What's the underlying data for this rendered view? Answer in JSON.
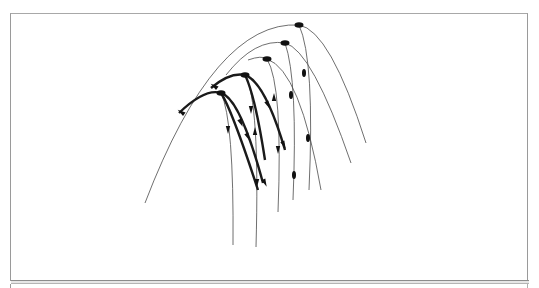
{
  "figure": {
    "colors": {
      "stroke": "#1a1a1a",
      "thin_stroke": "#4a4a4a",
      "frame": "#9a9a9a"
    },
    "outer_envelope": {
      "start": [
        145,
        203
      ],
      "apex": [
        299,
        25
      ],
      "end": [
        366,
        143
      ]
    },
    "apex_markers": [
      [
        299,
        25
      ],
      [
        285,
        43
      ],
      [
        267,
        59
      ],
      [
        245,
        75
      ],
      [
        221,
        93
      ]
    ],
    "thin_curves": [
      {
        "name": "curve-1",
        "d": "M145 203 Q 215 20 299 25 Q 330 30 366 143"
      },
      {
        "name": "curve-2",
        "d": "M226 75 Q 255 38 285 43 Q 312 50 351 163"
      },
      {
        "name": "curve-3",
        "d": "M248 60 Q 262 55 267 59 Q 300 70 321 190"
      },
      {
        "name": "drop-1",
        "d": "M299 25 Q 315 60 309 190"
      },
      {
        "name": "drop-2",
        "d": "M285 43 Q 298 80 293 200"
      },
      {
        "name": "drop-3",
        "d": "M267 59 Q 283 85 278 212"
      },
      {
        "name": "drop-4",
        "d": "M245 75 Q 260 100 256 247"
      },
      {
        "name": "drop-5",
        "d": "M221 93 Q 234 120 233 245"
      }
    ],
    "thick_curves": [
      {
        "name": "thick-1",
        "d": "M179 113 Q 205 88 221 93 Q 240 98 263 183"
      },
      {
        "name": "thick-2",
        "d": "M211 88 Q 230 72 245 75 Q 265 82 285 150"
      },
      {
        "name": "thick-3",
        "d": "M221 93 Q 232 110 258 190"
      },
      {
        "name": "thick-4",
        "d": "M245 75 Q 255 95 265 160"
      }
    ],
    "arrows": [
      {
        "at": [
          181,
          112
        ],
        "dir": "up-left"
      },
      {
        "at": [
          214,
          86
        ],
        "dir": "up-left"
      },
      {
        "at": [
          228,
          130
        ],
        "dir": "down"
      },
      {
        "at": [
          241,
          123
        ],
        "dir": "down-right"
      },
      {
        "at": [
          248,
          137
        ],
        "dir": "down-right"
      },
      {
        "at": [
          251,
          110
        ],
        "dir": "down"
      },
      {
        "at": [
          255,
          131
        ],
        "dir": "up"
      },
      {
        "at": [
          257,
          183
        ],
        "dir": "down"
      },
      {
        "at": [
          265,
          183
        ],
        "dir": "down-right"
      },
      {
        "at": [
          268,
          105
        ],
        "dir": "down-right"
      },
      {
        "at": [
          274,
          97
        ],
        "dir": "up"
      },
      {
        "at": [
          278,
          150
        ],
        "dir": "down"
      },
      {
        "at": [
          284,
          145
        ],
        "dir": "down-right"
      }
    ],
    "mid_markers": [
      [
        291,
        95
      ],
      [
        304,
        73
      ],
      [
        308,
        138
      ],
      [
        294,
        175
      ]
    ]
  }
}
